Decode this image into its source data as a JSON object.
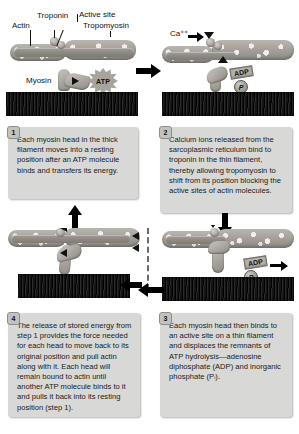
{
  "figure": {
    "background_color": "#ffffff",
    "textbox_color": "#d8d8d6"
  },
  "labels": {
    "actin": "Actin",
    "troponin": "Troponin",
    "active_site": "Active site",
    "tropomyosin": "Tropomyosin",
    "myosin": "Myosin",
    "atp": "ATP",
    "adp": "ADP",
    "pi": "P",
    "calcium": "Ca⁺⁺"
  },
  "steps": [
    {
      "number": "1",
      "text": "Each myosin head in the thick filament moves into a resting position after an ATP molecule binds and transfers its energy."
    },
    {
      "number": "2",
      "text": "Calcium ions released from the sarcoplasmic reticulum bind to troponin in the thin filament, thereby allowing tropomyosin to shift from its position blocking the active sites of actin molecules."
    },
    {
      "number": "3",
      "text": "Each myosin head then binds to an active site on a thin filament and displaces the remnants of ATP hydrolysis—adenosine diphosphate (ADP) and inorganic phosphate (Pᵢ)."
    },
    {
      "number": "4",
      "text": "The release of stored energy from step 1 provides the force needed for each head to move back to its original position and pull actin along with it.  Each head will remain bound to actin until another ATP molecule binds to it and pulls it back into its resting position (step 1)."
    }
  ],
  "flow": {
    "step1_to_step2": "arrow-right",
    "step2_to_step3": "arrow-down",
    "step3_to_step4": "arrow-left",
    "step4_to_step1": "arrow-up",
    "divider": "dashed-vertical"
  }
}
